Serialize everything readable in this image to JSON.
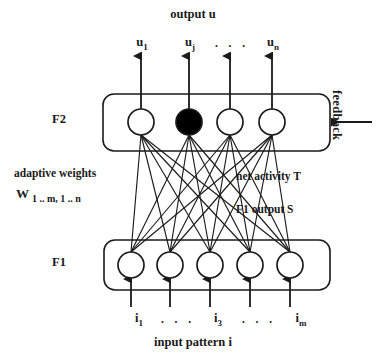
{
  "diagram": {
    "title": "output u",
    "caption": "input pattern i",
    "layers": {
      "f2": {
        "label": "F2",
        "node_count": 4,
        "filled_node_index": 1,
        "node_centers_x": [
          141,
          189,
          230,
          272
        ],
        "node_center_y": 122,
        "node_radius": 13,
        "box": {
          "x": 103,
          "y": 94,
          "width": 227,
          "height": 57
        }
      },
      "f1": {
        "label": "F1",
        "node_count": 5,
        "filled_node_index": -1,
        "node_centers_x": [
          131,
          170,
          210,
          250,
          290
        ],
        "node_center_y": 265,
        "node_radius": 13,
        "box": {
          "x": 104,
          "y": 240,
          "width": 226,
          "height": 50
        }
      }
    },
    "output_labels": [
      {
        "base": "u",
        "sub": "1"
      },
      {
        "base": "u",
        "sub": "j"
      },
      {
        "base": "u",
        "sub": "n"
      }
    ],
    "output_ellipsis": ". . .",
    "input_labels": [
      {
        "base": "i",
        "sub": "1"
      },
      {
        "base": "i",
        "sub": "3"
      },
      {
        "base": "i",
        "sub": "m"
      }
    ],
    "input_ellipsis_left": ". . .",
    "input_ellipsis_right": ". . .",
    "annotations": {
      "adaptive_weights": "adaptive weights",
      "weight_matrix_base": "W",
      "weight_matrix_sub": "1 .. m, 1 .. n",
      "net_activity": "net activity T",
      "f1_output": "F1 output S",
      "feedback": "feedback"
    },
    "colors": {
      "stroke": "#1a1a1a",
      "fill_node": "#ffffff",
      "fill_node_selected": "#000000",
      "background": "#ffffff",
      "text": "#1a1a1a"
    }
  }
}
